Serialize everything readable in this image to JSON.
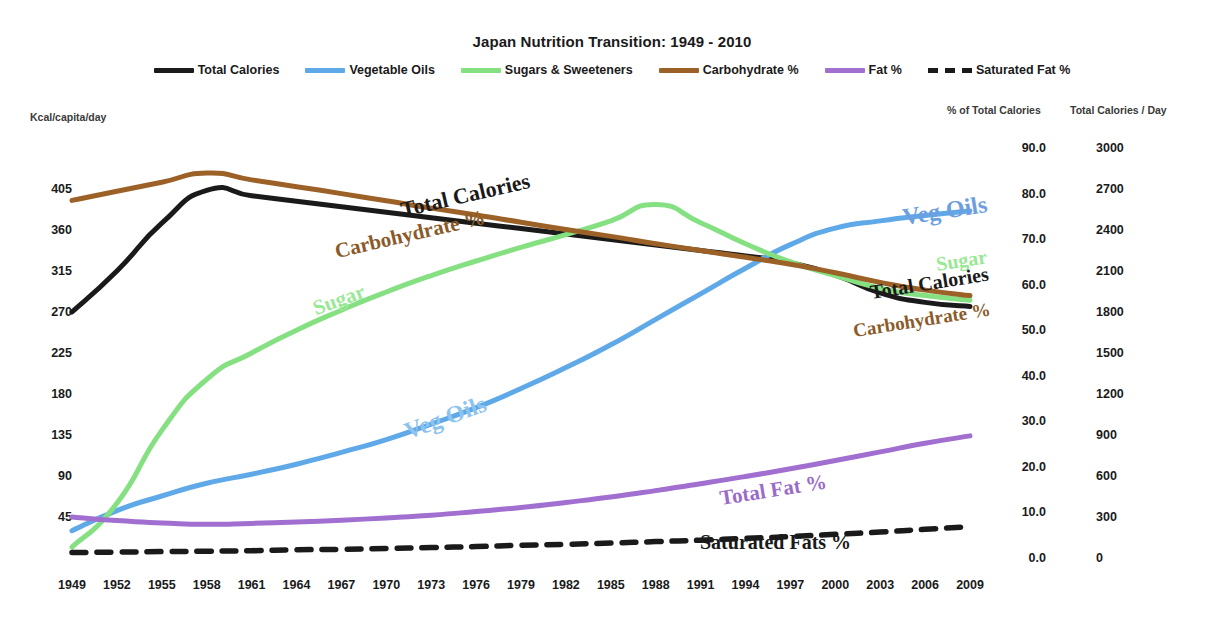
{
  "chart_data": {
    "type": "line",
    "title": "Japan Nutrition Transition: 1949 - 2010",
    "xlabel": "",
    "ylabel": "Kcal/capita/day",
    "grid": false,
    "legend_position": "top-center",
    "x_ticks": [
      "1949",
      "1952",
      "1955",
      "1958",
      "1961",
      "1964",
      "1967",
      "1970",
      "1973",
      "1976",
      "1979",
      "1982",
      "1985",
      "1988",
      "1991",
      "1994",
      "1997",
      "2000",
      "2003",
      "2006",
      "2009"
    ],
    "xlim": [
      1949,
      2010
    ],
    "axes": [
      {
        "id": "left",
        "caption": "Kcal/capita/day",
        "ticks": [
          "405",
          "360",
          "315",
          "270",
          "225",
          "180",
          "135",
          "90",
          "45"
        ],
        "lim": [
          0,
          450
        ],
        "applies_to": [
          "Vegetable Oils",
          "Sugars & Sweeteners"
        ]
      },
      {
        "id": "percent",
        "caption": "% of Total Calories",
        "ticks": [
          "90.0",
          "80.0",
          "70.0",
          "60.0",
          "50.0",
          "40.0",
          "30.0",
          "20.0",
          "10.0",
          "0.0"
        ],
        "lim": [
          0,
          90
        ],
        "applies_to": [
          "Carbohydrate %",
          "Fat %",
          "Saturated Fat %"
        ]
      },
      {
        "id": "calories",
        "caption": "Total Calories / Day",
        "ticks": [
          "3000",
          "2700",
          "2400",
          "2100",
          "1800",
          "1500",
          "1200",
          "900",
          "600",
          "300",
          "0"
        ],
        "lim": [
          0,
          3000
        ],
        "applies_to": [
          "Total Calories"
        ]
      }
    ],
    "legend": [
      {
        "label": "Total Calories",
        "color": "#1a1a1a",
        "style": "solid"
      },
      {
        "label": "Vegetable Oils",
        "color": "#5fa9e8",
        "style": "solid"
      },
      {
        "label": "Sugars & Sweeteners",
        "color": "#85e081",
        "style": "solid"
      },
      {
        "label": "Carbohydrate %",
        "color": "#9c6127",
        "style": "solid"
      },
      {
        "label": "Fat %",
        "color": "#a濃",
        "style": "solid"
      },
      {
        "label": "Saturated Fat %",
        "color": "#1a1a1a",
        "style": "dashed"
      }
    ],
    "x": [
      1949,
      1952,
      1955,
      1958,
      1961,
      1964,
      1967,
      1970,
      1973,
      1976,
      1979,
      1982,
      1985,
      1988,
      1991,
      1994,
      1997,
      2000,
      2003,
      2006,
      2009
    ],
    "series": [
      {
        "name": "Total Calories",
        "color": "#1a1a1a",
        "style": "solid",
        "axis": "calories",
        "unit": "kcal/day",
        "values": [
          1800,
          2100,
          2450,
          2690,
          2650,
          2610,
          2570,
          2530,
          2490,
          2450,
          2410,
          2370,
          2330,
          2290,
          2250,
          2210,
          2160,
          2070,
          1940,
          1870,
          1840
        ]
      },
      {
        "name": "Vegetable Oils",
        "color": "#5fa9e8",
        "style": "solid",
        "axis": "left",
        "unit": "kcal/capita/day",
        "values": [
          30,
          52,
          68,
          82,
          92,
          103,
          116,
          130,
          147,
          165,
          186,
          209,
          234,
          262,
          290,
          318,
          344,
          362,
          370,
          376,
          381
        ]
      },
      {
        "name": "Sugars & Sweeteners",
        "color": "#85e081",
        "style": "solid",
        "axis": "left",
        "unit": "kcal/capita/day",
        "values": [
          12,
          60,
          140,
          196,
          225,
          250,
          272,
          292,
          310,
          326,
          341,
          355,
          370,
          388,
          368,
          345,
          325,
          310,
          296,
          288,
          283
        ]
      },
      {
        "name": "Carbohydrate %",
        "color": "#9c6127",
        "style": "solid",
        "axis": "percent",
        "unit": "% of total calories",
        "values": [
          78.5,
          80.5,
          82.5,
          84.5,
          83.0,
          81.5,
          80.0,
          78.4,
          76.8,
          75.3,
          73.7,
          72.1,
          70.6,
          69.0,
          67.5,
          66.0,
          64.5,
          62.6,
          60.5,
          58.8,
          57.6
        ]
      },
      {
        "name": "Fat %",
        "color": "#a06fd0",
        "style": "solid",
        "axis": "percent",
        "unit": "% of total calories",
        "values": [
          9.0,
          8.2,
          7.7,
          7.4,
          7.6,
          7.9,
          8.3,
          8.8,
          9.4,
          10.2,
          11.1,
          12.2,
          13.4,
          14.8,
          16.3,
          17.9,
          19.6,
          21.4,
          23.3,
          25.2,
          26.8
        ]
      },
      {
        "name": "Saturated Fat %",
        "color": "#1a1a1a",
        "style": "dashed",
        "axis": "percent",
        "unit": "% of total calories",
        "values": [
          1.2,
          1.3,
          1.4,
          1.5,
          1.6,
          1.8,
          1.9,
          2.1,
          2.3,
          2.5,
          2.8,
          3.0,
          3.3,
          3.6,
          3.9,
          4.3,
          4.7,
          5.2,
          5.7,
          6.3,
          6.9
        ]
      }
    ],
    "annotations": [
      {
        "text": "Total Calories",
        "color": "#1a1a1a",
        "x": 404,
        "y": 197,
        "rotate": -13,
        "size": 22
      },
      {
        "text": "Carbohydrate %",
        "color": "#8a5a28",
        "x": 338,
        "y": 239,
        "rotate": -13,
        "size": 21
      },
      {
        "text": "Sugar",
        "color": "#9ae896",
        "x": 318,
        "y": 296,
        "rotate": -20,
        "size": 21
      },
      {
        "text": "Veg Oils",
        "color": "#8cc3ef",
        "x": 410,
        "y": 418,
        "rotate": -20,
        "size": 24
      },
      {
        "text": "Veg Oils",
        "color": "#6d9fe0",
        "x": 905,
        "y": 204,
        "rotate": -9,
        "size": 24
      },
      {
        "text": "Sugar",
        "color": "#9ae896",
        "x": 938,
        "y": 253,
        "rotate": -9,
        "size": 20
      },
      {
        "text": "Total Calories",
        "color": "#1a1a1a",
        "x": 872,
        "y": 281,
        "rotate": -9,
        "size": 20
      },
      {
        "text": "Carbohydrate %",
        "color": "#8a5a28",
        "x": 855,
        "y": 320,
        "rotate": -9,
        "size": 19
      },
      {
        "text": "Total Fat %",
        "color": "#9a6bc8",
        "x": 722,
        "y": 486,
        "rotate": -9,
        "size": 21
      },
      {
        "text": "Saturated Fats %",
        "color": "#1a1a1a",
        "x": 700,
        "y": 531,
        "rotate": 0,
        "size": 20
      }
    ]
  }
}
